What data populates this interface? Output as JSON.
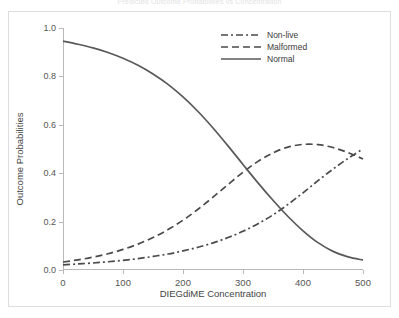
{
  "figure": {
    "title_strip": "Predicted Outcome Probabilities vs Concentration",
    "background": "#ffffff",
    "frame_color": "#dddddd",
    "axis_color": "#b9b9b9"
  },
  "chart_data": {
    "type": "line",
    "title": "",
    "xlabel": "DIEGdiME Concentration",
    "ylabel": "Outcome Probabilities",
    "xlim": [
      0,
      500
    ],
    "ylim": [
      0.0,
      1.0
    ],
    "xticks": [
      0,
      100,
      200,
      300,
      400,
      500
    ],
    "xtick_labels": [
      "0",
      "100",
      "200",
      "300",
      "400",
      "500"
    ],
    "yticks": [
      0.0,
      0.2,
      0.4,
      0.6,
      0.8,
      1.0
    ],
    "ytick_labels": [
      "0.0",
      "0.2",
      "0.4",
      "0.6",
      "0.8",
      "1.0"
    ],
    "grid": false,
    "legend_position": "top-right",
    "x": [
      0,
      25,
      50,
      75,
      100,
      125,
      150,
      175,
      200,
      225,
      250,
      275,
      300,
      325,
      350,
      375,
      400,
      425,
      450,
      475,
      500
    ],
    "series": [
      {
        "name": "Non-live",
        "linestyle": "dashdot",
        "color": "#4a4a4a",
        "values": [
          0.021,
          0.025,
          0.029,
          0.034,
          0.04,
          0.047,
          0.056,
          0.066,
          0.079,
          0.094,
          0.112,
          0.134,
          0.16,
          0.191,
          0.228,
          0.271,
          0.319,
          0.369,
          0.417,
          0.461,
          0.5
        ]
      },
      {
        "name": "Malformed",
        "linestyle": "dashed",
        "color": "#4a4a4a",
        "values": [
          0.033,
          0.042,
          0.053,
          0.067,
          0.085,
          0.107,
          0.134,
          0.167,
          0.206,
          0.251,
          0.301,
          0.353,
          0.404,
          0.449,
          0.484,
          0.508,
          0.519,
          0.518,
          0.506,
          0.485,
          0.459
        ]
      },
      {
        "name": "Normal",
        "linestyle": "solid",
        "color": "#595959",
        "values": [
          0.946,
          0.933,
          0.918,
          0.899,
          0.875,
          0.846,
          0.81,
          0.767,
          0.715,
          0.655,
          0.587,
          0.513,
          0.436,
          0.36,
          0.288,
          0.221,
          0.162,
          0.113,
          0.077,
          0.054,
          0.041
        ]
      }
    ],
    "legend_entries": [
      "Non-live",
      "Malformed",
      "Normal"
    ]
  }
}
